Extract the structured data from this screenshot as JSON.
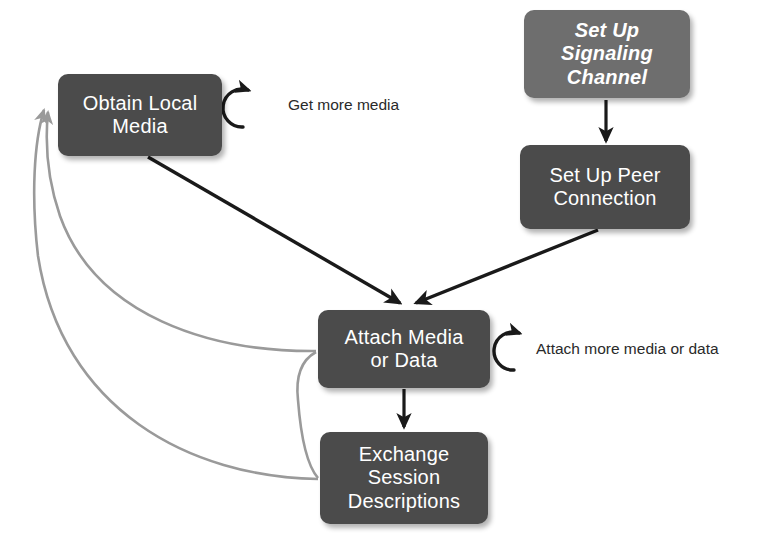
{
  "diagram": {
    "background_color": "#ffffff",
    "nodes": [
      {
        "id": "signaling",
        "label": "Set Up\nSignaling\nChannel",
        "fill": "#6e6e6e",
        "text_color": "#ffffff",
        "italic": true
      },
      {
        "id": "peer-connection",
        "label": "Set Up Peer\nConnection",
        "fill": "#4b4b4b",
        "text_color": "#ffffff",
        "italic": false
      },
      {
        "id": "obtain-local-media",
        "label": "Obtain Local\nMedia",
        "fill": "#4b4b4b",
        "text_color": "#ffffff",
        "italic": false
      },
      {
        "id": "attach-media-or-data",
        "label": "Attach Media\nor Data",
        "fill": "#4b4b4b",
        "text_color": "#ffffff",
        "italic": false
      },
      {
        "id": "exchange-session-descriptions",
        "label": "Exchange\nSession\nDescriptions",
        "fill": "#4b4b4b",
        "text_color": "#ffffff",
        "italic": false
      }
    ],
    "edges": [
      {
        "id": "signaling-to-peer",
        "from": "signaling",
        "to": "peer-connection",
        "label": "",
        "color": "#1a1a1a",
        "style": "straight"
      },
      {
        "id": "peer-to-attach",
        "from": "peer-connection",
        "to": "attach-media-or-data",
        "label": "",
        "color": "#1a1a1a",
        "style": "straight"
      },
      {
        "id": "obtain-to-attach",
        "from": "obtain-local-media",
        "to": "attach-media-or-data",
        "label": "",
        "color": "#1a1a1a",
        "style": "straight"
      },
      {
        "id": "attach-to-exchange",
        "from": "attach-media-or-data",
        "to": "exchange-session-descriptions",
        "label": "",
        "color": "#1a1a1a",
        "style": "straight"
      },
      {
        "id": "attach-back-to-obtain",
        "from": "attach-media-or-data",
        "to": "obtain-local-media",
        "label": "",
        "color": "#9a9a9a",
        "style": "curved"
      },
      {
        "id": "exchange-back-to-obtain",
        "from": "exchange-session-descriptions",
        "to": "obtain-local-media",
        "label": "",
        "color": "#9a9a9a",
        "style": "curved"
      },
      {
        "id": "attach-to-exchange-curve",
        "from": "attach-media-or-data",
        "to": "exchange-session-descriptions",
        "label": "",
        "color": "#9a9a9a",
        "style": "curved"
      }
    ],
    "self_loops": [
      {
        "id": "obtain-self-loop",
        "node": "obtain-local-media",
        "label": "Get more media",
        "color": "#1a1a1a"
      },
      {
        "id": "attach-self-loop",
        "node": "attach-media-or-data",
        "label": "Attach more media or data",
        "color": "#1a1a1a"
      }
    ]
  }
}
